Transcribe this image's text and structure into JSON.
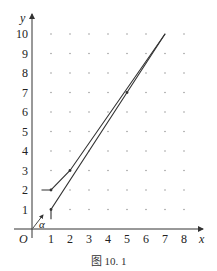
{
  "caption": "图 10. 1",
  "axes": {
    "x_label": "x",
    "y_label": "y",
    "origin_label": "O",
    "angle_label": "α",
    "x_ticks": [
      "1",
      "2",
      "3",
      "4",
      "5",
      "6",
      "7",
      "8"
    ],
    "y_ticks": [
      "1",
      "2",
      "3",
      "4",
      "5",
      "6",
      "7",
      "8",
      "9",
      "10"
    ]
  },
  "chart_data": {
    "type": "line",
    "title": "",
    "caption": "图 10. 1",
    "xlabel": "x",
    "ylabel": "y",
    "xlim": [
      0,
      8
    ],
    "ylim": [
      0,
      10
    ],
    "grid": "dots at integer lattice points",
    "x_tick_labels": [
      1,
      2,
      3,
      4,
      5,
      6,
      7,
      8
    ],
    "y_tick_labels": [
      1,
      2,
      3,
      4,
      5,
      6,
      7,
      8,
      9,
      10
    ],
    "series": [
      {
        "name": "path-upper",
        "points": [
          [
            0.5,
            2
          ],
          [
            1,
            2
          ],
          [
            2,
            3
          ],
          [
            7,
            10
          ]
        ]
      },
      {
        "name": "path-lower",
        "points": [
          [
            1,
            0.5
          ],
          [
            1,
            1
          ],
          [
            5,
            7
          ],
          [
            7,
            10
          ]
        ]
      }
    ],
    "marked_points": [
      [
        1,
        2
      ],
      [
        2,
        3
      ],
      [
        1,
        1
      ],
      [
        5,
        7
      ]
    ],
    "annotations": [
      {
        "text": "α",
        "type": "direction arrow near origin",
        "from": [
          0,
          0
        ],
        "to": [
          0.5,
          0.7
        ]
      },
      {
        "text": "O",
        "type": "origin label"
      }
    ],
    "colors": {
      "lines": "#333333",
      "grid_dots": "#888888",
      "axes": "#333333"
    }
  }
}
